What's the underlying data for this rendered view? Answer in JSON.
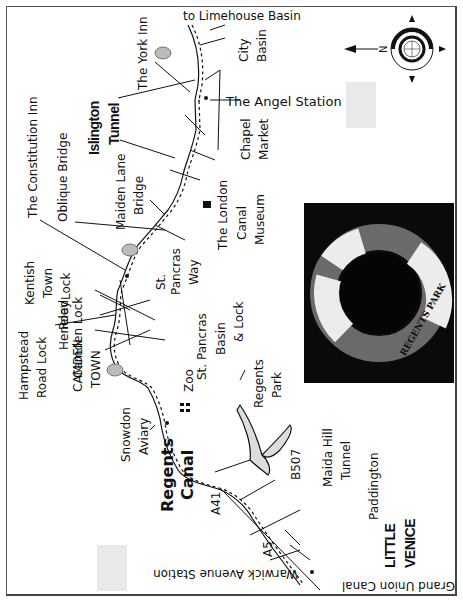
{
  "map": {
    "title": "Regents Canal Walk",
    "orientation": "rotated 90deg, north pointing left",
    "compass": {
      "label": "N",
      "direction": "left"
    },
    "waterway": {
      "name_line1": "Regents",
      "name_line2": "Canal"
    },
    "areas": {
      "little_venice_line1": "LITTLE",
      "little_venice_line2": "VENICE",
      "camden_line1": "CAMDEN",
      "camden_line2": "TOWN",
      "kentish_line1": "Kentish",
      "kentish_line2": "Town",
      "islington_line1": "Islington",
      "islington_line2": "Tunnel"
    },
    "landmarks": {
      "limehouse": "to Limehouse Basin",
      "city_basin_1": "City",
      "city_basin_2": "Basin",
      "york_inn": "The York Inn",
      "angel_station": "The Angel Station",
      "chapel_1": "Chapel",
      "chapel_2": "Market",
      "constitution_inn": "The Constitution Inn",
      "oblique_bridge": "Oblique Bridge",
      "maiden_1": "Maiden Lane",
      "maiden_2": "Bridge",
      "london_canal_1": "The London",
      "london_canal_2": "Canal",
      "london_canal_3": "Museum",
      "st_pancras_way_1": "St.",
      "st_pancras_way_2": "Pancras",
      "st_pancras_way_3": "Way",
      "st_pancras_basin_1": "St. Pancras",
      "st_pancras_basin_2": "Basin",
      "st_pancras_basin_3": "& Lock",
      "heneley_1": "Heneley",
      "heneley_2": "Road",
      "heneley_3": "Lock",
      "camden_lock": "Camden Lock",
      "hampstead_1": "Hampstead",
      "hampstead_2": "Road Lock",
      "zoo": "Zoo",
      "snowdon_1": "Snowdon",
      "snowdon_2": "Aviary",
      "regents_park_1": "Regents",
      "regents_park_2": "Park",
      "a41": "A41",
      "b507": "B507",
      "a5": "A5",
      "maida_1": "Maida Hill",
      "maida_2": "Tunnel",
      "paddington": "Paddington",
      "warwick_avenue": "Warwick Avenue Station",
      "grand_union": "Grand Union Canal"
    },
    "photo": {
      "caption": "REGENTS PARK",
      "description": "lifebuoy ring photo"
    }
  }
}
